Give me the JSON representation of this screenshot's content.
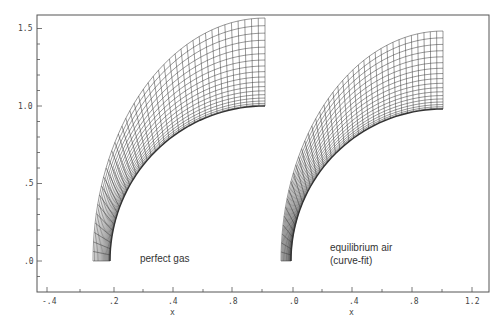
{
  "chart_data": {
    "type": "line",
    "title": "",
    "xlabel": "x",
    "ylabel": "",
    "ylim": [
      -0.2,
      1.6
    ],
    "y_ticks": [
      ".0",
      ".5",
      "1.0",
      "1.5"
    ],
    "y_tick_values": [
      0.0,
      0.5,
      1.0,
      1.5
    ],
    "panels": [
      {
        "name": "perfect gas",
        "annotation": "perfect gas",
        "x_ticks": [
          "-.4",
          ".2",
          ".4",
          ".8"
        ],
        "x_tick_values": [
          -0.4,
          0.2,
          0.4,
          0.8
        ],
        "xlabel": "x",
        "body_surface": {
          "type": "quarter-circle",
          "radius": 1.0
        },
        "outer_boundary_top_y": 1.55,
        "outer_boundary_bottom_x_offset": -0.12,
        "radial_lines": 40,
        "circumferential_lines": 18
      },
      {
        "name": "equilibrium air (curve-fit)",
        "annotation": [
          "equilibrium air",
          "(curve-fit)"
        ],
        "x_ticks": [
          ".0",
          ".4",
          ".8",
          "1.2"
        ],
        "x_tick_values": [
          0.0,
          0.4,
          0.8,
          1.2
        ],
        "xlabel": "x",
        "body_surface": {
          "type": "quarter-circle",
          "radius": 1.0
        },
        "outer_boundary_top_y": 1.47,
        "outer_boundary_bottom_x_offset": -0.06,
        "radial_lines": 40,
        "circumferential_lines": 18
      }
    ],
    "grid": false,
    "legend": null
  },
  "labels": {
    "y_ticks": [
      ".0",
      ".5",
      "1.0",
      "1.5"
    ],
    "left_x_ticks": [
      "-.4",
      ".2",
      ".4",
      ".8"
    ],
    "right_x_ticks": [
      ".0",
      ".4",
      ".8",
      "1.2"
    ],
    "left_xlabel": "x",
    "right_xlabel": "x",
    "left_annotation": "perfect gas",
    "right_annotation_line1": "equilibrium air",
    "right_annotation_line2": "(curve-fit)"
  },
  "colors": {
    "ink": "#333333",
    "frame": "#555555",
    "background": "#ffffff"
  }
}
